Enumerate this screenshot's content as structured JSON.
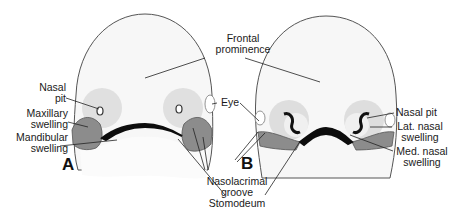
{
  "figure": {
    "panels": [
      {
        "id": "A",
        "letter": "A"
      },
      {
        "id": "B",
        "letter": "B"
      }
    ],
    "labels": {
      "frontal_prominence_1": "Frontal",
      "frontal_prominence_2": "prominence",
      "nasal_pit_a_1": "Nasal",
      "nasal_pit_a_2": "pit",
      "maxillary_1": "Maxillary",
      "maxillary_2": "swelling",
      "mandibular_1": "Mandibular",
      "mandibular_2": "swelling",
      "eye": "Eye",
      "nasolacrimal_1": "Nasolacrimal",
      "nasolacrimal_2": "groove",
      "stomodeum": "Stomodeum",
      "nasal_pit_b": "Nasal pit",
      "lat_nasal_1": "Lat. nasal",
      "lat_nasal_2": "swelling",
      "med_nasal_1": "Med. nasal",
      "med_nasal_2": "swelling"
    },
    "colors": {
      "head_fill": "#f7f7f7",
      "outline": "#555555",
      "nasal_placode": "#dcdcdc",
      "swelling": "#8a8a8a",
      "stomodeum": "#0d0d0d",
      "leader": "#222222"
    }
  }
}
